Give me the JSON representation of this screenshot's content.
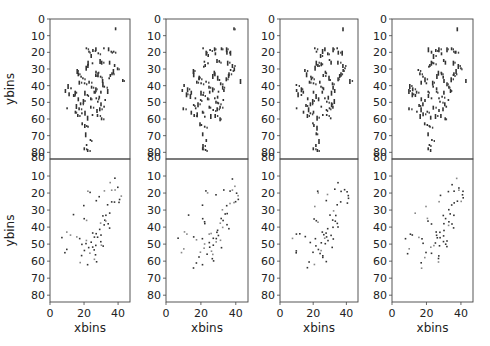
{
  "figure": {
    "width": 490,
    "height": 346
  },
  "axes_layout": {
    "columns_x": [
      [
        50,
        130
      ],
      [
        166,
        248
      ],
      [
        280,
        358
      ],
      [
        392,
        473
      ]
    ],
    "top_row_y": [
      19,
      159
    ],
    "bottom_row_y": [
      159,
      302
    ],
    "xlim": [
      0,
      47
    ],
    "ylim": [
      84,
      0
    ],
    "xticks": [
      0,
      20,
      40
    ],
    "yticks_top": [
      0,
      10,
      20,
      30,
      40,
      50,
      60,
      70,
      80
    ],
    "yticks_bottom": [
      10,
      20,
      30,
      40,
      50,
      60,
      70,
      80
    ],
    "xlabel": "xbins",
    "ylabel": "ybins"
  },
  "chart_data": {
    "type": "scatter",
    "title": "",
    "xlabel": "xbins",
    "ylabel": "ybins",
    "grid": false,
    "layout": "2x4 panels, shared axes, y inverted",
    "axis_ranges": {
      "x": [
        0,
        47
      ],
      "y": [
        84,
        0
      ]
    },
    "top_row_points": [
      [
        38,
        5
      ],
      [
        21,
        17
      ],
      [
        22,
        19
      ],
      [
        25,
        18
      ],
      [
        27,
        17
      ],
      [
        31,
        17
      ],
      [
        34,
        17
      ],
      [
        35,
        19
      ],
      [
        37,
        19
      ],
      [
        28,
        20
      ],
      [
        24,
        21
      ],
      [
        22,
        25
      ],
      [
        22,
        27
      ],
      [
        21,
        28
      ],
      [
        24,
        26
      ],
      [
        29,
        24
      ],
      [
        30,
        25
      ],
      [
        35,
        25
      ],
      [
        38,
        27
      ],
      [
        39,
        29
      ],
      [
        37,
        30
      ],
      [
        36,
        32
      ],
      [
        35,
        33
      ],
      [
        34,
        35
      ],
      [
        42,
        36
      ],
      [
        15,
        30
      ],
      [
        16,
        32
      ],
      [
        18,
        34
      ],
      [
        19,
        35
      ],
      [
        17,
        37
      ],
      [
        20,
        38
      ],
      [
        23,
        37
      ],
      [
        26,
        33
      ],
      [
        27,
        31
      ],
      [
        28,
        32
      ],
      [
        29,
        34
      ],
      [
        30,
        36
      ],
      [
        31,
        38
      ],
      [
        32,
        40
      ],
      [
        33,
        42
      ],
      [
        30,
        43
      ],
      [
        29,
        46
      ],
      [
        27,
        47
      ],
      [
        28,
        49
      ],
      [
        30,
        50
      ],
      [
        32,
        48
      ],
      [
        31,
        52
      ],
      [
        29,
        53
      ],
      [
        27,
        54
      ],
      [
        24,
        52
      ],
      [
        25,
        57
      ],
      [
        28,
        57
      ],
      [
        30,
        59
      ],
      [
        20,
        43
      ],
      [
        21,
        45
      ],
      [
        23,
        47
      ],
      [
        25,
        43
      ],
      [
        24,
        40
      ],
      [
        26,
        41
      ],
      [
        19,
        48
      ],
      [
        18,
        50
      ],
      [
        16,
        47
      ],
      [
        14,
        43
      ],
      [
        13,
        45
      ],
      [
        12,
        41
      ],
      [
        10,
        39
      ],
      [
        9,
        42
      ],
      [
        11,
        44
      ],
      [
        15,
        51
      ],
      [
        17,
        53
      ],
      [
        18,
        56
      ],
      [
        20,
        55
      ],
      [
        22,
        58
      ],
      [
        14,
        55
      ],
      [
        10,
        53
      ],
      [
        16,
        57
      ],
      [
        19,
        62
      ],
      [
        20,
        63
      ],
      [
        21,
        68
      ],
      [
        22,
        64
      ],
      [
        23,
        72
      ],
      [
        21,
        75
      ],
      [
        20,
        77
      ],
      [
        22,
        78
      ]
    ],
    "bottom_row_points": [
      [
        37,
        11
      ],
      [
        35,
        14
      ],
      [
        39,
        16
      ],
      [
        38,
        18
      ],
      [
        40,
        19
      ],
      [
        41,
        21
      ],
      [
        41,
        23
      ],
      [
        36,
        25
      ],
      [
        38,
        25
      ],
      [
        40,
        25
      ],
      [
        34,
        27
      ],
      [
        32,
        30
      ],
      [
        30,
        33
      ],
      [
        33,
        32
      ],
      [
        35,
        32
      ],
      [
        31,
        35
      ],
      [
        33,
        36
      ],
      [
        34,
        38
      ],
      [
        35,
        40
      ],
      [
        32,
        39
      ],
      [
        30,
        37
      ],
      [
        29,
        41
      ],
      [
        28,
        43
      ],
      [
        30,
        45
      ],
      [
        31,
        47
      ],
      [
        29,
        48
      ],
      [
        30,
        50
      ],
      [
        31,
        51
      ],
      [
        27,
        50
      ],
      [
        26,
        46
      ],
      [
        25,
        43
      ],
      [
        26,
        44
      ],
      [
        28,
        46
      ],
      [
        24,
        49
      ],
      [
        25,
        53
      ],
      [
        26,
        56
      ],
      [
        26,
        58
      ],
      [
        27,
        60
      ],
      [
        23,
        55
      ],
      [
        22,
        52
      ],
      [
        21,
        47
      ],
      [
        21,
        50
      ],
      [
        20,
        54
      ],
      [
        18,
        57
      ],
      [
        17,
        60
      ],
      [
        16,
        63
      ],
      [
        21,
        62
      ],
      [
        24,
        51
      ],
      [
        22,
        18
      ],
      [
        23,
        19
      ],
      [
        20,
        27
      ],
      [
        21,
        36
      ],
      [
        22,
        37
      ],
      [
        20,
        35
      ],
      [
        13,
        32
      ],
      [
        10,
        43
      ],
      [
        11,
        44
      ],
      [
        7,
        46
      ],
      [
        9,
        55
      ],
      [
        10,
        53
      ],
      [
        17,
        47
      ],
      [
        18,
        49
      ],
      [
        15,
        45
      ],
      [
        27,
        24
      ],
      [
        28,
        21
      ],
      [
        32,
        18
      ],
      [
        36,
        18
      ]
    ],
    "panels": [
      {
        "row": 0,
        "col": 0
      },
      {
        "row": 0,
        "col": 1
      },
      {
        "row": 0,
        "col": 2
      },
      {
        "row": 0,
        "col": 3
      },
      {
        "row": 1,
        "col": 0
      },
      {
        "row": 1,
        "col": 1
      },
      {
        "row": 1,
        "col": 2
      },
      {
        "row": 1,
        "col": 3
      }
    ]
  }
}
